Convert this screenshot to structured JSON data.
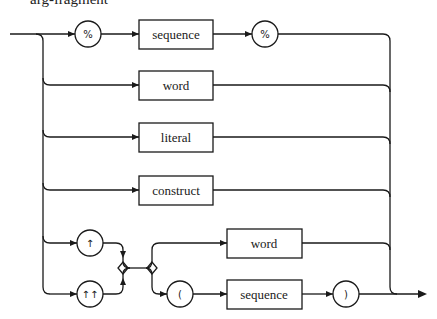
{
  "title": "arg-fragment",
  "diagram": {
    "type": "syntax-railroad",
    "alternatives": [
      {
        "id": "percent-sequence",
        "items": [
          {
            "kind": "terminal",
            "text": "%"
          },
          {
            "kind": "nonterminal",
            "text": "sequence"
          },
          {
            "kind": "terminal",
            "text": "%"
          }
        ]
      },
      {
        "id": "word",
        "items": [
          {
            "kind": "nonterminal",
            "text": "word"
          }
        ]
      },
      {
        "id": "literal",
        "items": [
          {
            "kind": "nonterminal",
            "text": "literal"
          }
        ]
      },
      {
        "id": "construct",
        "items": [
          {
            "kind": "nonterminal",
            "text": "construct"
          }
        ]
      },
      {
        "id": "up-arrow-group",
        "prefix_choices": [
          {
            "kind": "terminal",
            "text": "↑"
          },
          {
            "kind": "terminal",
            "text": "↑↑"
          }
        ],
        "suffix_choices": [
          [
            {
              "kind": "nonterminal",
              "text": "word"
            }
          ],
          [
            {
              "kind": "terminal",
              "text": "("
            },
            {
              "kind": "nonterminal",
              "text": "sequence"
            },
            {
              "kind": "terminal",
              "text": ")"
            }
          ]
        ]
      }
    ]
  },
  "labels": {
    "pct_open": "%",
    "sequence_top": "sequence",
    "pct_close": "%",
    "word_top": "word",
    "literal": "literal",
    "construct": "construct",
    "up_single": "↑",
    "up_double": "↑↑",
    "word_bottom": "word",
    "paren_open": "(",
    "sequence_bottom": "sequence",
    "paren_close": ")"
  }
}
